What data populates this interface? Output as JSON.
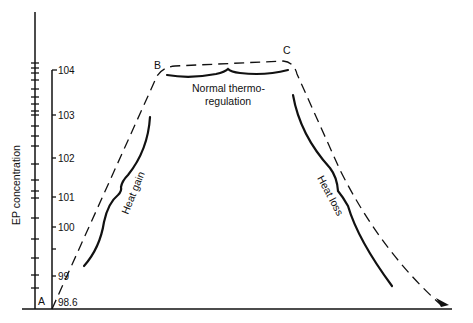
{
  "figure": {
    "y_axis_label": "EP concentration",
    "temperature_scale": {
      "ticks": [
        {
          "label": "104",
          "y": 70
        },
        {
          "label": "103",
          "y": 115
        },
        {
          "label": "102",
          "y": 158
        },
        {
          "label": "101",
          "y": 197
        },
        {
          "label": "100",
          "y": 227
        },
        {
          "label": "",
          "y": 249
        },
        {
          "label": "99",
          "y": 276
        },
        {
          "label": "98.6",
          "y": 302
        }
      ]
    },
    "points": {
      "a": "A",
      "b": "B",
      "c": "C"
    },
    "annotations": {
      "heat_gain": "Heat gain",
      "heat_loss": "Heat loss",
      "normal_line1": "Normal thermo-",
      "normal_line2": "regulation"
    },
    "colors": {
      "ink": "#111111",
      "background": "#ffffff"
    }
  }
}
